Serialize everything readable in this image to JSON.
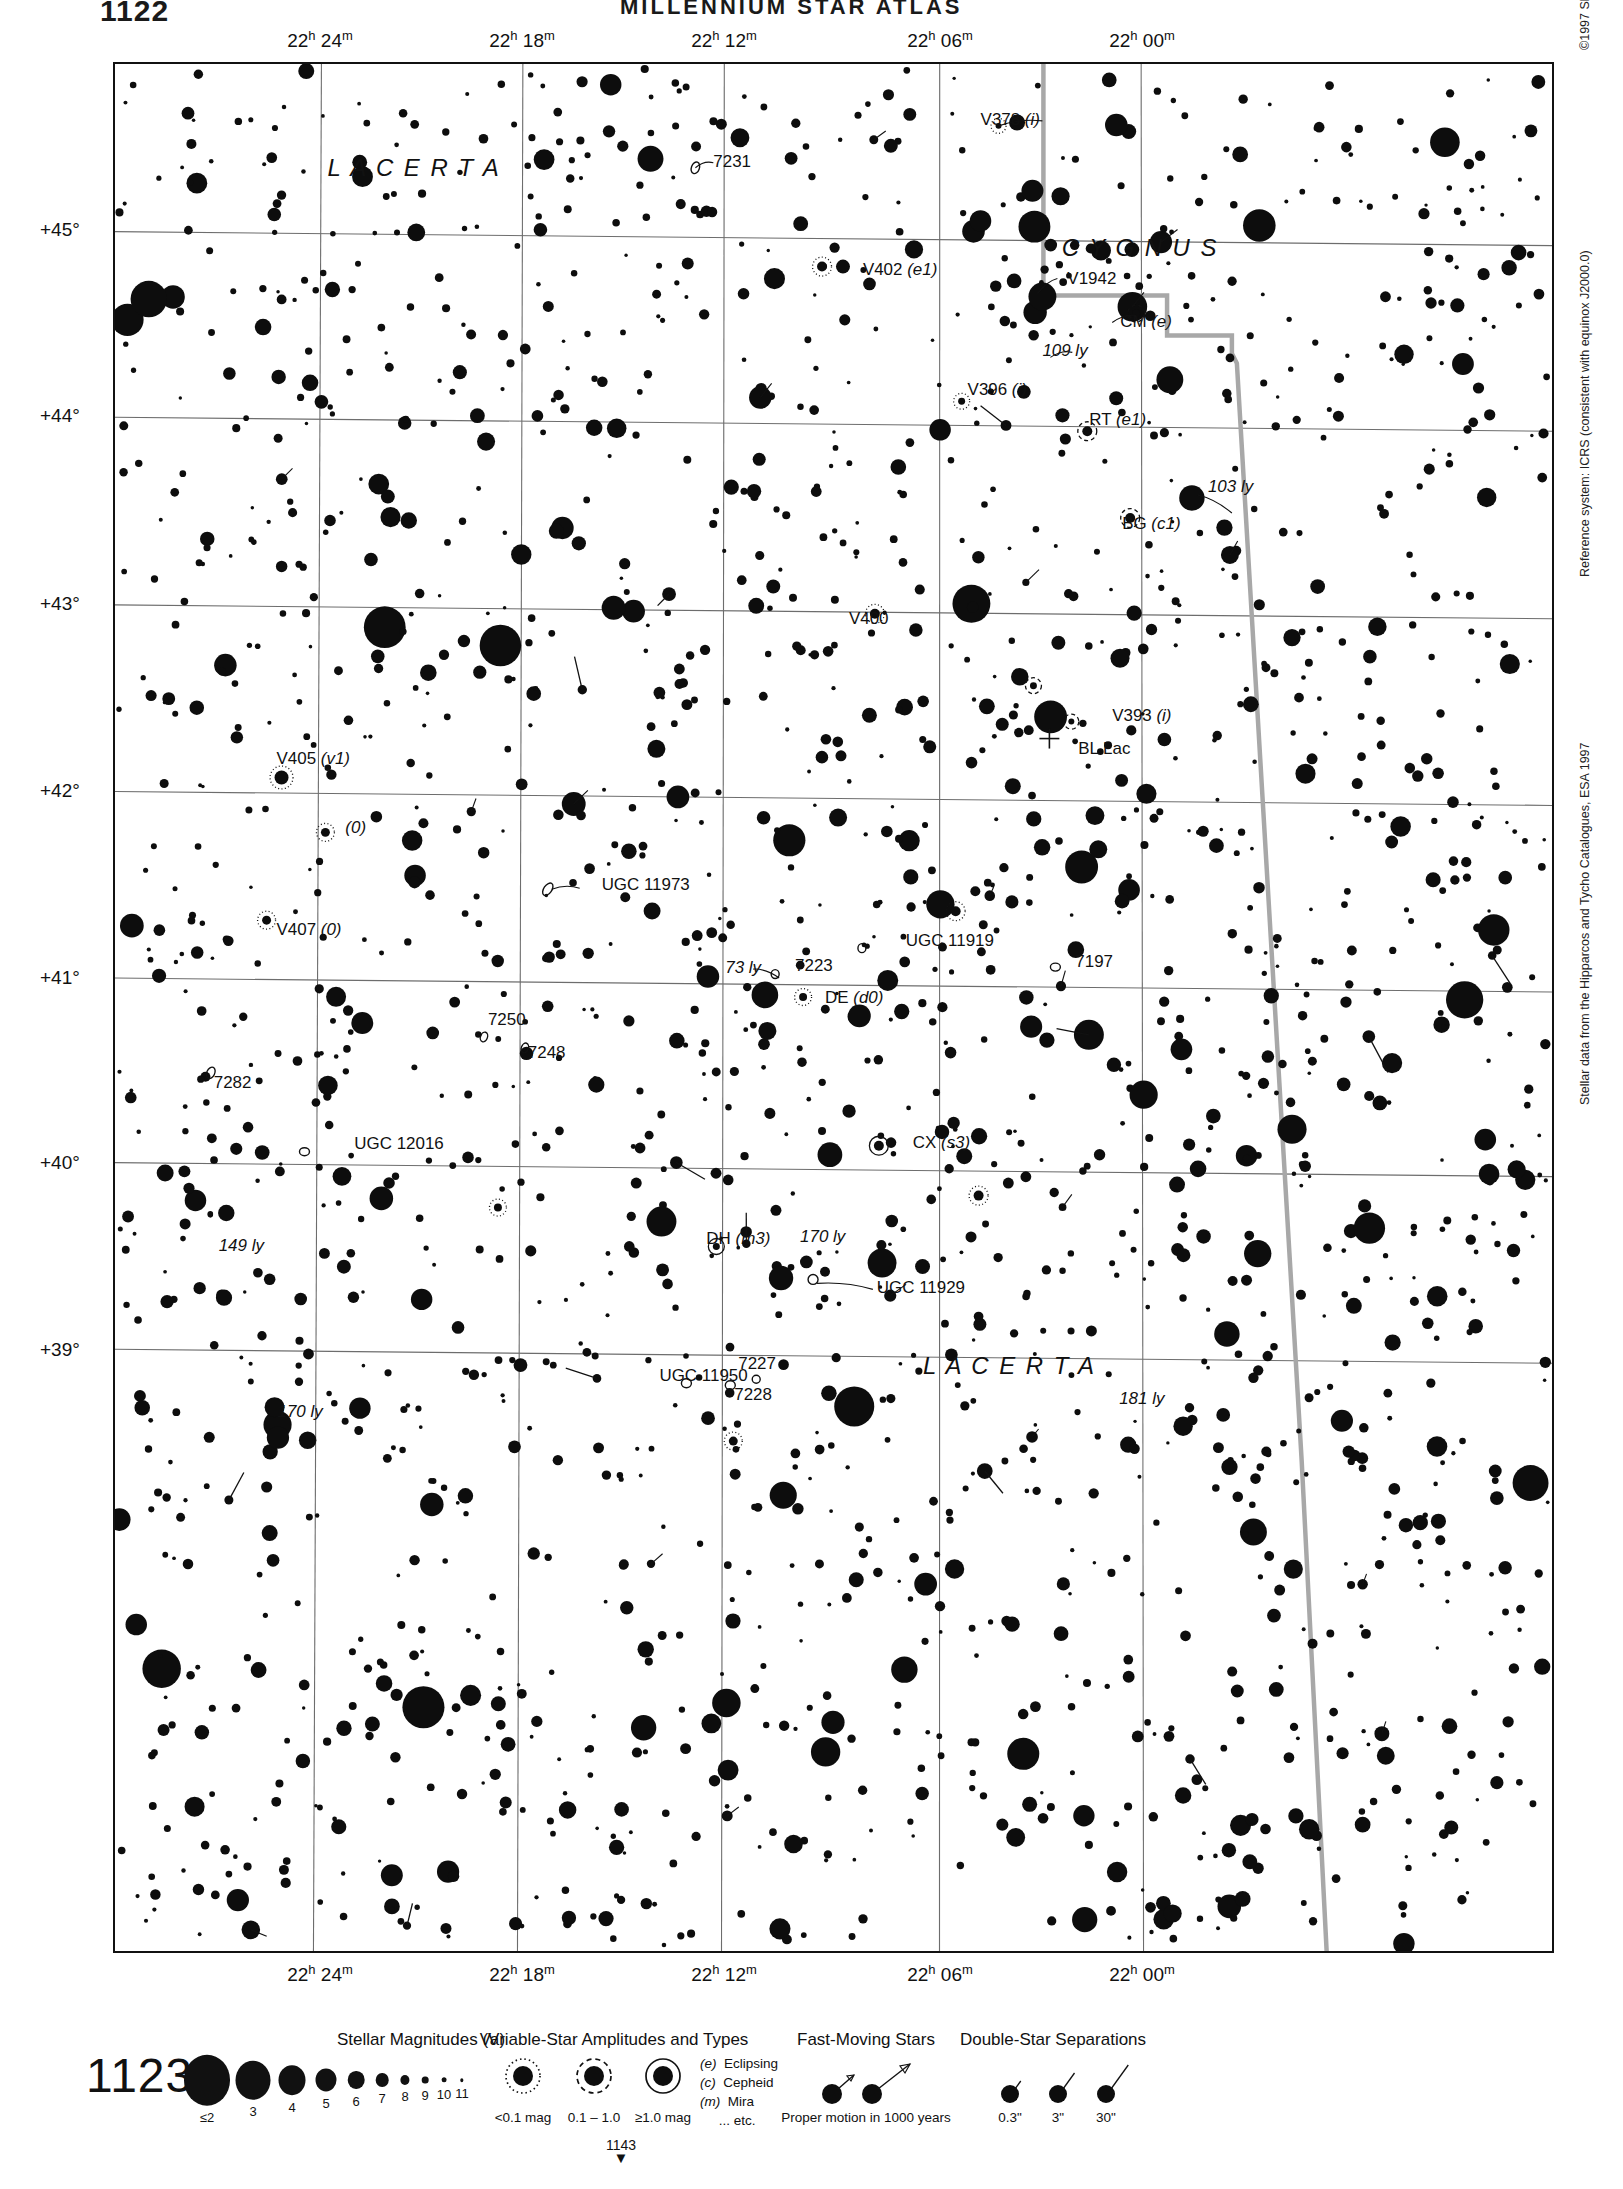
{
  "header": {
    "page_number": "1122",
    "title": "MILLENNIUM STAR ATLAS"
  },
  "chart": {
    "number": "1123",
    "next_chart": "1143",
    "next_chart_arrow": "▼",
    "ra_ticks": [
      {
        "label": "22h 24m",
        "h": "22",
        "m": "24",
        "x": 207
      },
      {
        "label": "22h 18m",
        "h": "22",
        "m": "18",
        "x": 409
      },
      {
        "label": "22h 12m",
        "h": "22",
        "m": "12",
        "x": 611
      },
      {
        "label": "22h 06m",
        "h": "22",
        "m": "06",
        "x": 827
      },
      {
        "label": "22h 00m",
        "h": "22",
        "m": "00",
        "x": 1029
      }
    ],
    "dec_ticks": [
      {
        "label": "+45°",
        "y": 168
      },
      {
        "label": "+44°",
        "y": 354
      },
      {
        "label": "+43°",
        "y": 542
      },
      {
        "label": "+42°",
        "y": 729
      },
      {
        "label": "+41°",
        "y": 916
      },
      {
        "label": "+40°",
        "y": 1101
      },
      {
        "label": "+39°",
        "y": 1288
      }
    ],
    "constellations": [
      {
        "name": "L A C E R T A",
        "x": 300,
        "y": 112
      },
      {
        "name": "C Y G N U S",
        "x": 1028,
        "y": 192
      },
      {
        "name": "L A C E R T A",
        "x": 897,
        "y": 1313
      }
    ],
    "labels": [
      {
        "text": "V378 (i)",
        "x": 868,
        "y": 61,
        "italic_tail": "(i)"
      },
      {
        "text": "7231",
        "x": 600,
        "y": 103
      },
      {
        "text": "V402 (e1)",
        "x": 750,
        "y": 211
      },
      {
        "text": "V1942",
        "x": 955,
        "y": 220
      },
      {
        "text": "CM (e)",
        "x": 1008,
        "y": 264
      },
      {
        "text": "109 ly",
        "x": 930,
        "y": 293
      },
      {
        "text": "V396 (i)",
        "x": 855,
        "y": 332
      },
      {
        "text": "RT (e1)",
        "x": 977,
        "y": 362
      },
      {
        "text": "103 ly",
        "x": 1096,
        "y": 429
      },
      {
        "text": "BG (c1)",
        "x": 1010,
        "y": 466
      },
      {
        "text": "V400",
        "x": 736,
        "y": 561
      },
      {
        "text": "V393 (i)",
        "x": 1000,
        "y": 658
      },
      {
        "text": "BL Lac",
        "x": 966,
        "y": 691
      },
      {
        "text": "V405 (v1)",
        "x": 162,
        "y": 701
      },
      {
        "text": "(0)",
        "x": 231,
        "y": 771
      },
      {
        "text": "UGC 11973",
        "x": 488,
        "y": 828
      },
      {
        "text": "V407 (0)",
        "x": 162,
        "y": 873
      },
      {
        "text": "UGC 11919",
        "x": 793,
        "y": 884
      },
      {
        "text": "73 ly",
        "x": 612,
        "y": 911
      },
      {
        "text": "7223",
        "x": 682,
        "y": 909
      },
      {
        "text": "7197",
        "x": 963,
        "y": 905
      },
      {
        "text": "DE (d0)",
        "x": 712,
        "y": 941
      },
      {
        "text": "7250",
        "x": 374,
        "y": 963
      },
      {
        "text": "7248",
        "x": 414,
        "y": 996
      },
      {
        "text": "7282",
        "x": 99,
        "y": 1026
      },
      {
        "text": "UGC 12016",
        "x": 240,
        "y": 1087
      },
      {
        "text": "CX (s3)",
        "x": 800,
        "y": 1086
      },
      {
        "text": "149 ly",
        "x": 104,
        "y": 1190
      },
      {
        "text": "DH (m3)",
        "x": 593,
        "y": 1183
      },
      {
        "text": "170 ly",
        "x": 687,
        "y": 1181
      },
      {
        "text": "UGC 11929",
        "x": 764,
        "y": 1232
      },
      {
        "text": "UGC 11950",
        "x": 546,
        "y": 1320
      },
      {
        "text": "7227",
        "x": 625,
        "y": 1308
      },
      {
        "text": "7228",
        "x": 621,
        "y": 1339
      },
      {
        "text": "181 ly",
        "x": 1007,
        "y": 1343
      },
      {
        "text": "170 ly",
        "x": 163,
        "y": 1356
      }
    ]
  },
  "side_credits": [
    {
      "text": "©1997 Sky Publishing Corporation",
      "x": 1578,
      "y": 50
    },
    {
      "text": "Reference system: ICRS (consistent with equinox J2000.0)",
      "x": 1578,
      "y": 577
    },
    {
      "text": "Stellar data from the Hipparcos and Tycho Catalogues, ESA 1997",
      "x": 1578,
      "y": 1105
    }
  ],
  "legend": {
    "magnitudes": {
      "title": "Stellar Magnitudes (V)",
      "title_x": 421,
      "items": [
        {
          "label": "≤2",
          "x": 207,
          "r": 23
        },
        {
          "label": "3",
          "x": 253,
          "r": 17.5
        },
        {
          "label": "4",
          "x": 292,
          "r": 13.5
        },
        {
          "label": "5",
          "x": 326,
          "r": 10.5
        },
        {
          "label": "6",
          "x": 356,
          "r": 8.3
        },
        {
          "label": "7",
          "x": 382,
          "r": 6.3
        },
        {
          "label": "8",
          "x": 405,
          "r": 4.6
        },
        {
          "label": "9",
          "x": 425,
          "r": 3.3
        },
        {
          "label": "10",
          "x": 444,
          "r": 2.4
        },
        {
          "label": "11",
          "x": 462,
          "r": 1.7
        }
      ]
    },
    "variables": {
      "title": "Variable-Star Amplitudes and Types",
      "title_x": 614,
      "items": [
        {
          "label": "<0.1 mag",
          "x": 523,
          "style": "dotted"
        },
        {
          "label": "0.1 – 1.0",
          "x": 594,
          "style": "dashed"
        },
        {
          "label": "≥1.0 mag",
          "x": 663,
          "style": "solid"
        }
      ],
      "types": [
        {
          "code": "(e)",
          "name": "Eclipsing"
        },
        {
          "code": "(c)",
          "name": "Cepheid"
        },
        {
          "code": "(m)",
          "name": "Mira"
        },
        {
          "code": "",
          "name": "... etc."
        }
      ]
    },
    "fast_moving": {
      "title": "Fast-Moving Stars",
      "title_x": 866,
      "caption": "Proper motion in 1000 years",
      "caption_x": 866
    },
    "double_stars": {
      "title": "Double-Star Separations",
      "title_x": 1053,
      "items": [
        {
          "label": "0.3\"",
          "x": 1010
        },
        {
          "label": "3\"",
          "x": 1058
        },
        {
          "label": "30\"",
          "x": 1106
        }
      ]
    }
  },
  "chart_data": {
    "type": "scatter",
    "xlabel": "Right Ascension (J2000)",
    "ylabel": "Declination (J2000)",
    "xlim": [
      "22h 26m",
      "21h 58m"
    ],
    "ylim": [
      38.6,
      45.6
    ],
    "grid": true,
    "legend": "bottom"
  }
}
